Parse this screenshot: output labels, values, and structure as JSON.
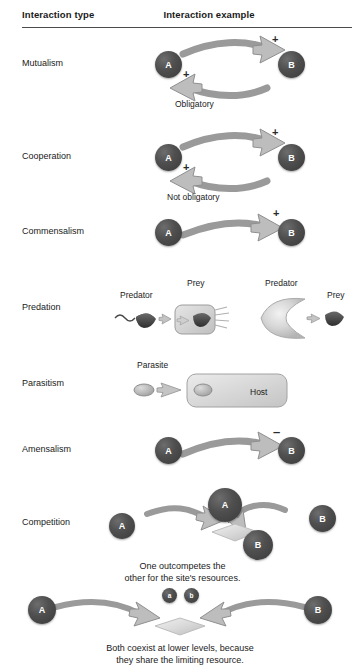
{
  "header": {
    "col_type": "Interaction type",
    "col_example": "Interaction example"
  },
  "rows": [
    {
      "label": "Mutualism",
      "nodes": [
        {
          "text": "A"
        },
        {
          "text": "B"
        }
      ],
      "signs": [
        "+",
        "+"
      ],
      "caption": "Obligatory"
    },
    {
      "label": "Cooperation",
      "nodes": [
        {
          "text": "A"
        },
        {
          "text": "B"
        }
      ],
      "signs": [
        "+",
        "+"
      ],
      "caption": "Not obligatory"
    },
    {
      "label": "Commensalism",
      "nodes": [
        {
          "text": "A"
        },
        {
          "text": "B"
        }
      ],
      "signs": [
        "+"
      ],
      "caption": ""
    },
    {
      "label": "Predation",
      "left_predator": "Predator",
      "left_prey": "Prey",
      "right_predator": "Predator",
      "right_prey": "Prey"
    },
    {
      "label": "Parasitism",
      "parasite": "Parasite",
      "host": "Host"
    },
    {
      "label": "Amensalism",
      "nodes": [
        {
          "text": "A"
        },
        {
          "text": "B"
        }
      ],
      "signs": [
        "–"
      ],
      "caption": ""
    },
    {
      "label": "Competition",
      "nodes": [
        {
          "text": "A"
        },
        {
          "text": "A"
        },
        {
          "text": "B"
        },
        {
          "text": "B"
        }
      ],
      "caption_line1": "One outcompetes the",
      "caption_line2": "other for the site's resources."
    }
  ],
  "coexist_panel": {
    "nodes": [
      {
        "text": "A"
      },
      {
        "text": "B"
      }
    ],
    "small_nodes": [
      {
        "text": "a"
      },
      {
        "text": "b"
      }
    ],
    "caption_line1": "Both coexist at lower levels, because",
    "caption_line2": "they share the limiting resource."
  },
  "colors": {
    "organism_dark": "#4a4a4a",
    "arrow_fill": "#bdbdbd",
    "arrow_stroke": "#8f8f8f",
    "text": "#1a1a1a",
    "rule": "#4a4a4a",
    "background": "#ffffff"
  }
}
